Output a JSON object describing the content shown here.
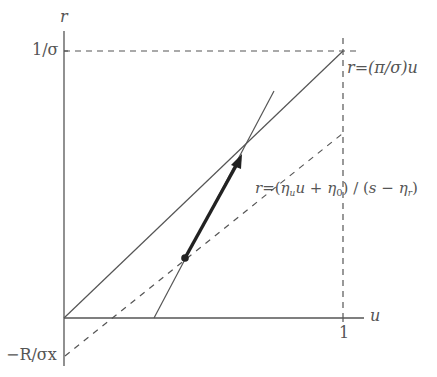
{
  "diagram": {
    "type": "phase-line diagram",
    "colors": {
      "line": "#555555",
      "thick_arrow": "#222222",
      "text": "#555555",
      "background": "#ffffff"
    },
    "axes": {
      "y_label": "r",
      "x_label": "u",
      "y_tick_top": "1/σ",
      "y_tick_bottom": "−R/σx",
      "x_tick": "1"
    },
    "lines": {
      "upper": {
        "label_lhs": "r",
        "label_eq": "=",
        "label_rhs": "(π/σ)u",
        "style": "solid"
      },
      "dashed": {
        "label_lhs": "r",
        "label_eq": "=",
        "label_open": "(",
        "label_eta_u": "η",
        "label_eta_u_sub": "u",
        "label_u": "u",
        "label_plus": " + ",
        "label_eta_0": "η",
        "label_eta_0_sub": "0",
        "label_close_div": ") / (",
        "label_s": "s",
        "label_minus": " − ",
        "label_eta_r": "η",
        "label_eta_r_sub": "r",
        "label_close": ")",
        "style": "dashed"
      },
      "steep": {
        "style": "solid"
      },
      "reference_top": {
        "style": "dashed",
        "description": "r = 1/σ"
      },
      "reference_right": {
        "style": "dashed",
        "description": "u = 1"
      }
    },
    "arrow": {
      "description": "thick arrow from dashed line up steep line to intersection",
      "start_dot": true
    }
  }
}
